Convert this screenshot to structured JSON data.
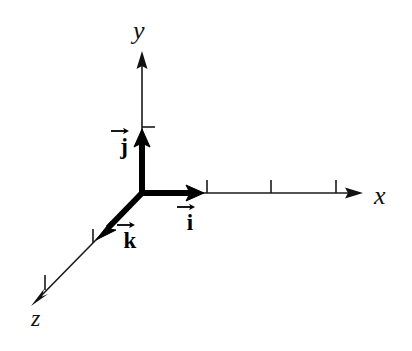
{
  "figure": {
    "background_color": "#ffffff",
    "stroke_color": "#111111",
    "vector_color": "#000000",
    "width": 412,
    "height": 351
  },
  "axes": [
    {
      "id": "x",
      "label": "x",
      "direction": "right",
      "origin": [
        142,
        193
      ],
      "tip": [
        362,
        193
      ],
      "tick_positions": [
        207,
        271,
        336
      ],
      "label_position": [
        374,
        183
      ]
    },
    {
      "id": "y",
      "label": "y",
      "direction": "up",
      "origin": [
        142,
        193
      ],
      "tip": [
        142,
        52
      ],
      "tick_positions": [
        127
      ],
      "label_position": [
        133,
        18
      ]
    },
    {
      "id": "z",
      "label": "z",
      "direction": "down-left",
      "origin": [
        142,
        193
      ],
      "tip": [
        32,
        305
      ],
      "tick_positions": [
        [
          93,
          236
        ],
        [
          45,
          283
        ]
      ],
      "label_position": [
        31,
        306
      ]
    }
  ],
  "vectors": [
    {
      "id": "i",
      "label": "i",
      "accent": "vector-arrow",
      "axis": "x",
      "from": [
        142,
        193
      ],
      "to": [
        202,
        193
      ],
      "label_position": [
        176,
        202
      ]
    },
    {
      "id": "j",
      "label": "j",
      "accent": "vector-arrow",
      "axis": "y",
      "from": [
        142,
        193
      ],
      "to": [
        142,
        131
      ],
      "label_position": [
        110,
        126
      ]
    },
    {
      "id": "k",
      "label": "k",
      "accent": "vector-arrow",
      "axis": "z",
      "from": [
        142,
        193
      ],
      "to": [
        97,
        239
      ],
      "label_position": [
        116,
        220
      ]
    }
  ],
  "icons": {
    "vector_accent": "right-arrow-accent-icon",
    "axis_arrowhead": "arrowhead-icon"
  }
}
